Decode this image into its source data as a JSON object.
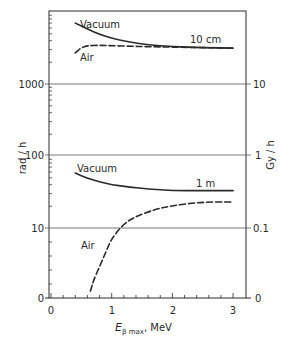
{
  "chart_data": {
    "type": "line",
    "title": "",
    "xlabel": "E_β max, MeV",
    "xlabel_main": "E",
    "xlabel_sub": "β max",
    "xlabel_unit": ", MeV",
    "ylabel_left": "rad / h",
    "ylabel_right": "Gy / h",
    "xlim": [
      0,
      3.2
    ],
    "x_ticks": [
      "0",
      "1",
      "2",
      "3"
    ],
    "y_left_ticks": [
      "0",
      "10",
      "100",
      "1000"
    ],
    "y_right_ticks": [
      "0",
      "0.1",
      "1",
      "10"
    ],
    "y_scale": "log (broken at 0)",
    "grid": "horizontal lines at 10, 100, 1000",
    "panels": [
      {
        "distance_label": "10 cm",
        "series": [
          {
            "name": "Vacuum",
            "style": "solid",
            "x": [
              0.4,
              0.6,
              0.8,
              1.0,
              1.3,
              1.6,
              2.0,
              2.5,
              3.0
            ],
            "y": [
              7000,
              5800,
              4900,
              4300,
              3800,
              3500,
              3300,
              3200,
              3150
            ]
          },
          {
            "name": "Air",
            "style": "dashed",
            "x": [
              0.4,
              0.5,
              0.6,
              0.8,
              1.0,
              1.3,
              1.6,
              2.0,
              2.5,
              3.0
            ],
            "y": [
              2700,
              3200,
              3400,
              3450,
              3400,
              3350,
              3300,
              3250,
              3200,
              3150
            ]
          }
        ]
      },
      {
        "distance_label": "1 m",
        "series": [
          {
            "name": "Vacuum",
            "style": "solid",
            "x": [
              0.4,
              0.6,
              0.8,
              1.0,
              1.3,
              1.6,
              2.0,
              2.5,
              3.0
            ],
            "y": [
              58,
              49,
              44,
              40,
              37,
              35,
              33,
              33,
              33
            ]
          },
          {
            "name": "Air",
            "style": "dashed",
            "x": [
              0.65,
              0.7,
              0.8,
              0.9,
              1.0,
              1.2,
              1.4,
              1.7,
              2.0,
              2.5,
              3.0
            ],
            "y": [
              1,
              2.5,
              4.5,
              6.5,
              8.5,
              11.5,
              14.5,
              18,
              20.5,
              23,
              23
            ]
          }
        ]
      }
    ]
  },
  "labels": {
    "vacuum_top": "Vacuum",
    "air_top": "Air",
    "dist_top": "10 cm",
    "vacuum_bottom": "Vacuum",
    "air_bottom": "Air",
    "dist_bottom": "1 m"
  }
}
